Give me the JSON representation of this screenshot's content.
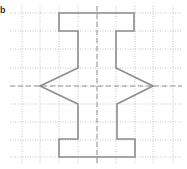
{
  "figure": {
    "label": "b",
    "grid": {
      "x_lines": [
        22,
        40,
        59,
        78,
        97,
        116,
        135,
        153,
        173
      ],
      "y_lines": [
        13,
        31,
        49,
        68,
        86,
        104,
        122,
        140,
        157
      ],
      "x_extent": [
        10,
        182
      ],
      "y_extent": [
        6,
        164
      ],
      "color": "#b8b8b8"
    },
    "axes_of_symmetry": {
      "vertical_x": 97,
      "horizontal_y": 86,
      "color": "#8a8a8a"
    },
    "shape": {
      "stroke": "#8c8c8c",
      "points": "59,13 134,13 134,31 116,31 116,68 153,86 117,104 117,139 135,139 135,157 59,157 59,139 78,139 78,104 40,86 78,68 78,31 59,31"
    }
  }
}
